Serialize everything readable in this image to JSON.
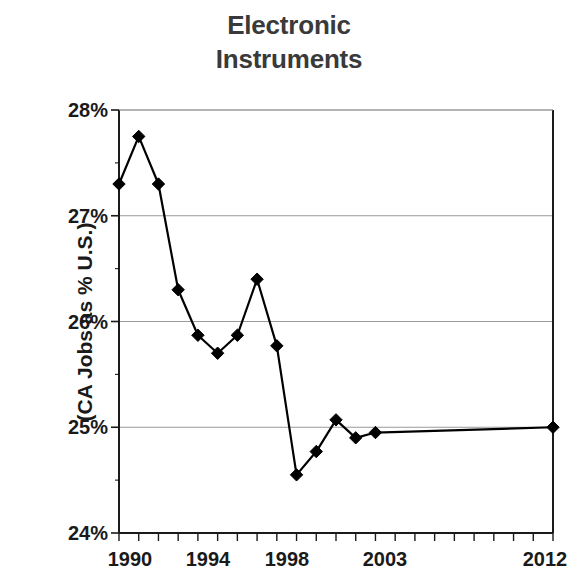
{
  "chart_data": {
    "type": "line",
    "title": "Electronic Instruments",
    "title_lines": [
      "Electronic",
      "Instruments"
    ],
    "xlabel": "",
    "ylabel": "(CA Jobs as % U.S.)",
    "ylim": [
      24,
      28
    ],
    "xlim": [
      1990,
      2012
    ],
    "y_ticks": [
      28,
      27,
      26,
      25,
      24
    ],
    "y_tick_labels": [
      "28%",
      "27%",
      "26%",
      "25%",
      "24%"
    ],
    "x_tick_labels": [
      "1990",
      "1994",
      "1998",
      "2003",
      "2012"
    ],
    "x_tick_values": [
      1990,
      1994,
      1998,
      2003,
      2012
    ],
    "grid": "horizontal",
    "legend": "none",
    "marker": "filled-diamond",
    "marker_color": "#000000",
    "line_color": "#000000",
    "x": [
      1990,
      1991,
      1992,
      1993,
      1994,
      1995,
      1996,
      1997,
      1998,
      1999,
      2000,
      2001,
      2002,
      2003,
      2012
    ],
    "values": [
      27.3,
      27.75,
      27.3,
      26.3,
      25.87,
      25.7,
      25.87,
      26.4,
      25.77,
      24.55,
      24.77,
      25.07,
      24.9,
      24.95,
      25.0
    ],
    "points": [
      {
        "x": 1990,
        "y": 27.3
      },
      {
        "x": 1991,
        "y": 27.75
      },
      {
        "x": 1992,
        "y": 27.3
      },
      {
        "x": 1993,
        "y": 26.3
      },
      {
        "x": 1994,
        "y": 25.87
      },
      {
        "x": 1995,
        "y": 25.7
      },
      {
        "x": 1996,
        "y": 25.87
      },
      {
        "x": 1997,
        "y": 26.4
      },
      {
        "x": 1998,
        "y": 25.77
      },
      {
        "x": 1999,
        "y": 24.55
      },
      {
        "x": 2000,
        "y": 24.77
      },
      {
        "x": 2001,
        "y": 25.07
      },
      {
        "x": 2002,
        "y": 24.9
      },
      {
        "x": 2003,
        "y": 24.95
      },
      {
        "x": 2012,
        "y": 25.0
      }
    ]
  },
  "colors": {
    "title": "#3a3a3a",
    "axis": "#000000",
    "grid": "#9a9a9a",
    "series": "#000000",
    "background": "#ffffff"
  }
}
